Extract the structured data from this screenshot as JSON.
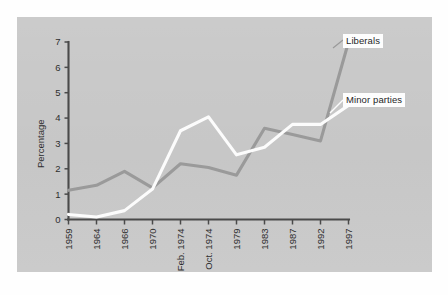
{
  "figure": {
    "background_color": "#c9c9c9",
    "canvas_color": "#ffffff"
  },
  "axes": {
    "y_axis_title": "Percentage",
    "y_ticks": [
      "0",
      "1",
      "2",
      "3",
      "4",
      "5",
      "6",
      "7"
    ],
    "x_ticks": [
      "1959",
      "1964",
      "1966",
      "1970",
      "Feb. 1974",
      "Oct. 1974",
      "1979",
      "1983",
      "1987",
      "1992",
      "1997"
    ]
  },
  "callouts": {
    "liberals": "Liberals",
    "minor_parties": "Minor parties"
  },
  "chart_data": {
    "type": "line",
    "title": "",
    "xlabel": "",
    "ylabel": "Percentage",
    "ylim": [
      0,
      7
    ],
    "grid": false,
    "legend_position": "inline-callout-right",
    "categories": [
      "1959",
      "1964",
      "1966",
      "1970",
      "Feb. 1974",
      "Oct. 1974",
      "1979",
      "1983",
      "1987",
      "1992",
      "1997"
    ],
    "series": [
      {
        "name": "Liberals",
        "color": "#9a9a9a",
        "values": [
          1.15,
          1.35,
          1.9,
          1.25,
          2.2,
          2.05,
          1.75,
          3.6,
          3.35,
          3.1,
          7.0
        ]
      },
      {
        "name": "Minor parties",
        "color": "#fcfcfc",
        "values": [
          0.2,
          0.1,
          0.35,
          1.2,
          3.5,
          4.05,
          2.55,
          2.85,
          3.75,
          3.75,
          4.5
        ]
      }
    ]
  }
}
